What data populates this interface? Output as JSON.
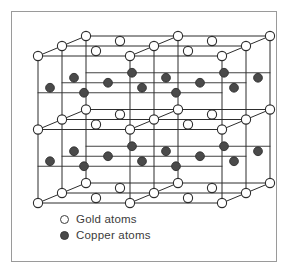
{
  "figure": {
    "border_color": "#9a9a9a",
    "background_color": "#ffffff"
  },
  "legend": {
    "items": [
      {
        "marker": "open-circle",
        "label": "Gold atoms",
        "color": "#ffffff",
        "stroke": "#3c3c3c"
      },
      {
        "marker": "filled-circle",
        "label": "Copper atoms",
        "color": "#4a4a4a",
        "stroke": "#3a3a3a"
      }
    ]
  },
  "lattice": {
    "type": "ordered-alloy-unit-cell-block",
    "projection": "oblique",
    "cells_x": 2,
    "cells_y": 2,
    "cells_z": 2,
    "origin_x": 38,
    "origin_y": 203,
    "cell_width": 92,
    "cell_height": 73.5,
    "depth_dx": 24,
    "depth_dy": -10,
    "levels": 5,
    "layer_species": [
      "gold",
      "copper",
      "gold",
      "copper",
      "gold"
    ],
    "atom_radius_gold": 4.6,
    "atom_radius_copper": 4.4,
    "line_color": "#2d2d2d",
    "line_width": 1.0,
    "gold_fill": "#ffffff",
    "gold_stroke": "#2d2d2d",
    "copper_fill": "#4a4a4a",
    "copper_stroke": "#303030"
  }
}
